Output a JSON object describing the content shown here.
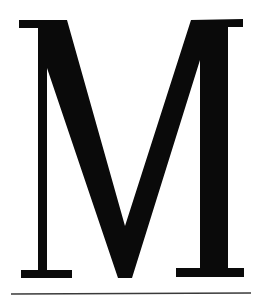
{
  "glyph": {
    "character": "M",
    "style": "serif capital letter",
    "fill_color": "#0a0a0a"
  },
  "rule": {
    "color": "#3a3a3a"
  },
  "background": "#ffffff"
}
